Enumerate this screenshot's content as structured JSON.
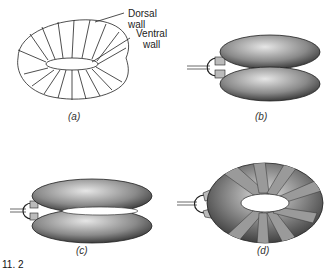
{
  "figure": {
    "panels": [
      {
        "id": "a",
        "caption": "(a)",
        "kind": "line-drawing",
        "description": "Toroidal balloon outline with segment lines"
      },
      {
        "id": "b",
        "caption": "(b)",
        "kind": "stippled",
        "description": "Inflated toroid, side view with inlet tube"
      },
      {
        "id": "c",
        "caption": "(c)",
        "kind": "stippled",
        "description": "Inflated toroid, open view with inlet tube"
      },
      {
        "id": "d",
        "caption": "(d)",
        "kind": "stippled-banded",
        "description": "Toroid wrapped with grey bands"
      }
    ],
    "labels": {
      "dorsal": "Dorsal wall",
      "ventral_line1": "Ventral",
      "ventral_line2": "wall"
    },
    "fig_fragment": "11. 2",
    "colors": {
      "line": "#222222",
      "stipple_dark": "#3a3a3a",
      "stipple_light": "#d9d9d9",
      "band": "#9a9a9a",
      "background": "#ffffff"
    }
  }
}
